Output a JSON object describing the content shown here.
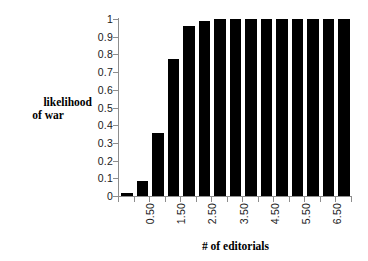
{
  "chart_data": {
    "type": "bar",
    "title": "",
    "xlabel": "# of editorials",
    "ylabel_line1": "likelihood",
    "ylabel_line2": "of war",
    "ylim": [
      0,
      1
    ],
    "ytick_values": [
      0,
      0.1,
      0.2,
      0.3,
      0.4,
      0.5,
      0.6,
      0.7,
      0.8,
      0.9,
      1
    ],
    "ytick_labels": [
      "0",
      "0.1",
      "0.2",
      "0.3",
      "0.4",
      "0.5",
      "0.6",
      "0.7",
      "0.8",
      "0.9",
      "1"
    ],
    "grid": false,
    "legend": "none",
    "bar_color": "#000000",
    "axis_color": "#8d8d8d",
    "n_bars": 15,
    "categories": [
      "0.00",
      "0.50",
      "1.00",
      "1.50",
      "2.00",
      "2.50",
      "3.00",
      "3.50",
      "4.00",
      "4.50",
      "5.00",
      "5.50",
      "6.00",
      "6.50",
      "7.00"
    ],
    "xtick_labels_shown": [
      "0.50",
      "1.50",
      "2.50",
      "3.50",
      "4.50",
      "5.50",
      "6.50"
    ],
    "xtick_label_indices": [
      1,
      3,
      5,
      7,
      9,
      11,
      13
    ],
    "values": [
      0.015,
      0.085,
      0.355,
      0.775,
      0.96,
      0.99,
      1.0,
      1.0,
      1.0,
      1.0,
      1.0,
      1.0,
      1.0,
      1.0,
      1.0
    ]
  }
}
